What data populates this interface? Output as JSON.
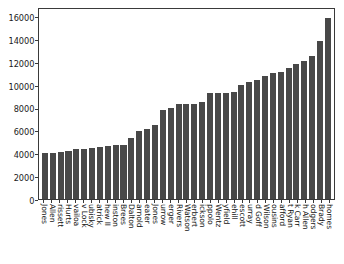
{
  "chart_data": {
    "type": "bar",
    "title": "",
    "xlabel": "",
    "ylabel": "",
    "grid": false,
    "legend": null,
    "ylim": [
      0,
      16800
    ],
    "yticks": [
      0,
      2000,
      4000,
      6000,
      8000,
      10000,
      12000,
      14000,
      16000
    ],
    "ytick_labels": [
      "0",
      "2000",
      "4000",
      "6000",
      "8000",
      "10000",
      "12000",
      "14000",
      "16000"
    ],
    "bar_color": "#484848",
    "xtick_rotation": 90,
    "categories": [
      "Jones",
      "Allen",
      "rissett",
      "Hurts",
      "vailoa",
      "v Lock",
      "ubisky",
      "atrick",
      "hew II",
      "inston",
      "Brees",
      "Dalton",
      "arnold",
      "eater",
      "Jones",
      "urrow",
      "erger",
      "Rivers",
      "Watson",
      "erbert",
      "ickson",
      "ppolo",
      "Wentz",
      "yfield",
      "ehill",
      "escott",
      "urray",
      "d Goff",
      "Wilson",
      "ousins",
      "afford",
      "t Ryan",
      "k Carr",
      "h Allen",
      "odgers",
      "Brady",
      "homes"
    ],
    "values": [
      4000,
      4050,
      4120,
      4200,
      4350,
      4420,
      4500,
      4580,
      4650,
      4700,
      4750,
      5350,
      5950,
      6150,
      6450,
      7750,
      7980,
      8300,
      8320,
      8320,
      8500,
      9250,
      9300,
      9300,
      9400,
      10000,
      10250,
      10450,
      10800,
      11000,
      11100,
      11500,
      11800,
      12100,
      12500,
      13850,
      15850
    ]
  }
}
